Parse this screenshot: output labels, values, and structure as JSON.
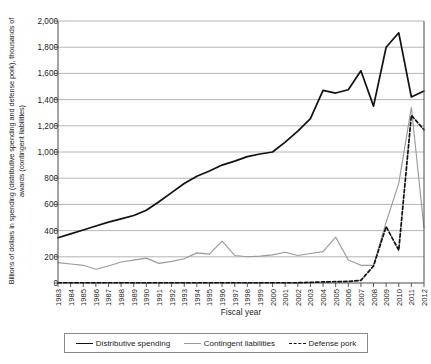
{
  "chart_data": {
    "type": "line",
    "title": "",
    "xlabel": "Fiscal year",
    "ylabel": "Billions of dollars in spending (distributive spending and defense pork), thousands of awards (contingent liabilities)",
    "ylim": [
      0,
      2000
    ],
    "ytick_step": 200,
    "grid": true,
    "legend_position": "bottom",
    "categories": [
      "1983",
      "1984",
      "1985",
      "1986",
      "1987",
      "1988",
      "1989",
      "1990",
      "1991",
      "1992",
      "1993",
      "1994",
      "1995",
      "1996",
      "1997",
      "1998",
      "1999",
      "2000",
      "2001",
      "2002",
      "2003",
      "2004",
      "2005",
      "2006",
      "2007",
      "2008",
      "2009",
      "2010",
      "2011",
      "2012"
    ],
    "yticks": [
      "0",
      "200",
      "400",
      "600",
      "800",
      "1,000",
      "1,200",
      "1,400",
      "1,600",
      "1,800",
      "2,000"
    ],
    "series": [
      {
        "name": "Distributive spending",
        "color": "#111111",
        "style": "solid",
        "values": [
          345,
          375,
          405,
          435,
          465,
          490,
          515,
          555,
          620,
          690,
          760,
          815,
          855,
          900,
          930,
          965,
          985,
          1000,
          1075,
          1160,
          1255,
          1330,
          1470,
          1450,
          1465,
          1475,
          1620,
          1350,
          1800,
          1910
        ]
      },
      {
        "name": "Contingent liabilities",
        "color": "#9a9a9a",
        "style": "solid",
        "values": [
          155,
          145,
          135,
          125,
          105,
          130,
          160,
          190,
          150,
          160,
          185,
          210,
          230,
          220,
          250,
          320,
          215,
          210,
          200,
          205,
          210,
          215,
          235,
          220,
          215,
          240,
          260,
          350,
          215,
          175
        ]
      },
      {
        "name": "Defense pork",
        "color": "#111111",
        "style": "dashed",
        "values": [
          5,
          5,
          5,
          5,
          5,
          5,
          5,
          5,
          5,
          5,
          5,
          5,
          5,
          5,
          5,
          5,
          5,
          5,
          5,
          5,
          8,
          10,
          12,
          15,
          18,
          20,
          22,
          25,
          30,
          35
        ]
      }
    ],
    "series_full": {
      "note": "Values aligned to all 30 fiscal years 1983-2012",
      "distributive_spending": [
        345,
        375,
        405,
        435,
        465,
        490,
        515,
        555,
        620,
        690,
        760,
        815,
        855,
        900,
        930,
        965,
        985,
        1000,
        1075,
        1160,
        1255,
        1470,
        1450,
        1475,
        1620,
        1350,
        1800,
        1910,
        1420,
        1465
      ],
      "contingent_liabilities": [
        155,
        145,
        135,
        105,
        130,
        160,
        175,
        190,
        150,
        165,
        185,
        230,
        220,
        320,
        210,
        200,
        205,
        215,
        235,
        210,
        225,
        240,
        350,
        175,
        135,
        135,
        465,
        760,
        1340,
        420
      ],
      "defense_pork": [
        2,
        2,
        2,
        2,
        2,
        2,
        2,
        2,
        2,
        2,
        2,
        2,
        2,
        2,
        2,
        2,
        2,
        2,
        2,
        2,
        5,
        8,
        10,
        12,
        20,
        130,
        430,
        250,
        1280,
        1170
      ]
    }
  },
  "legend": {
    "items": [
      {
        "label": "Distributive spending",
        "swatch": "solid-dark"
      },
      {
        "label": "Contingent liabilities",
        "swatch": "solid-gray"
      },
      {
        "label": "Defense pork",
        "swatch": "dashed"
      }
    ]
  },
  "axis": {
    "x_title": "Fiscal year",
    "y_title": "Billions of dollars in spending (distributive spending and defense pork), thousands of awards (contingent liabilities)"
  }
}
